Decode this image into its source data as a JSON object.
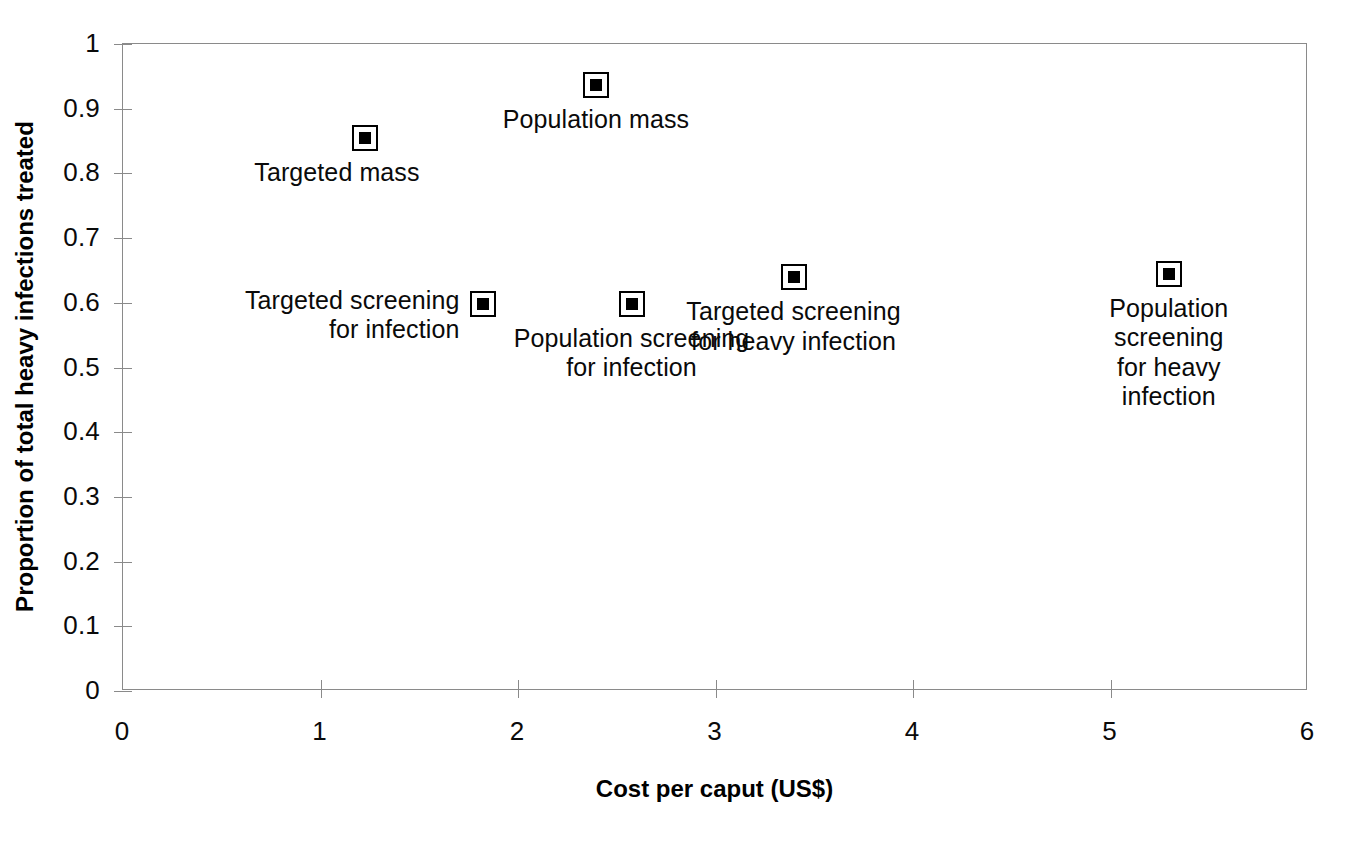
{
  "chart_data": {
    "type": "scatter",
    "title": "",
    "xlabel": "Cost per caput (US$)",
    "ylabel": "Proportion of total heavy infections treated",
    "xlim": [
      0,
      6
    ],
    "ylim": [
      0,
      1
    ],
    "xticks": [
      "0",
      "1",
      "2",
      "3",
      "4",
      "5",
      "6"
    ],
    "xtick_values": [
      0,
      1,
      2,
      3,
      4,
      5,
      6
    ],
    "yticks": [
      "0",
      "0.1",
      "0.2",
      "0.3",
      "0.4",
      "0.5",
      "0.6",
      "0.7",
      "0.8",
      "0.9",
      "1"
    ],
    "ytick_values": [
      0,
      0.1,
      0.2,
      0.3,
      0.4,
      0.5,
      0.6,
      0.7,
      0.8,
      0.9,
      1
    ],
    "grid": false,
    "legend": "none",
    "marker_style": "square-outline-with-filled-center",
    "marker_color": "#000000",
    "points": [
      {
        "label": "Targeted mass",
        "x": 1.23,
        "y": 0.853,
        "label_position": "below-left",
        "label_align": "center"
      },
      {
        "label": "Population mass",
        "x": 2.4,
        "y": 0.935,
        "label_position": "below",
        "label_align": "center"
      },
      {
        "label": "Targeted screening\nfor infection",
        "x": 1.83,
        "y": 0.597,
        "label_position": "left",
        "label_align": "center"
      },
      {
        "label": "Population screening\nfor infection",
        "x": 2.58,
        "y": 0.597,
        "label_position": "below",
        "label_align": "center"
      },
      {
        "label": "Targeted screening\nfor heavy infection",
        "x": 3.4,
        "y": 0.638,
        "label_position": "below",
        "label_align": "center"
      },
      {
        "label": "Population screening\nfor heavy infection",
        "x": 5.3,
        "y": 0.643,
        "label_position": "below",
        "label_align": "center"
      }
    ]
  },
  "axes": {
    "frame_color": "#8a8a8a",
    "text_color": "#0a0a0a"
  }
}
